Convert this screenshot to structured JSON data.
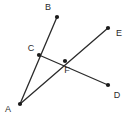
{
  "figure": {
    "type": "geometry-diagram",
    "width": 132,
    "height": 121,
    "background_color": "#ffffff",
    "stroke_color": "#2b2b2b",
    "label_color": "#2b2b2b",
    "point_color": "#1a1a1a",
    "point_radius": 2.1,
    "stroke_width": 1.3,
    "label_font_size": 9
  },
  "points": [
    {
      "id": "A",
      "label": "A",
      "x": 20,
      "y": 104,
      "label_x": 8,
      "label_y": 110
    },
    {
      "id": "B",
      "label": "B",
      "x": 57,
      "y": 17,
      "label_x": 48,
      "label_y": 8
    },
    {
      "id": "C",
      "label": "C",
      "x": 39,
      "y": 55,
      "label_x": 31,
      "label_y": 49
    },
    {
      "id": "D",
      "label": "D",
      "x": 108,
      "y": 85,
      "label_x": 117,
      "label_y": 96
    },
    {
      "id": "E",
      "label": "E",
      "x": 108,
      "y": 28,
      "label_x": 119,
      "label_y": 34
    },
    {
      "id": "F",
      "label": "F",
      "x": 65,
      "y": 61,
      "label_x": 67,
      "label_y": 71
    }
  ],
  "segments": [
    {
      "id": "AB",
      "from": "A",
      "to": "B",
      "through": [
        "C"
      ]
    },
    {
      "id": "AE",
      "from": "A",
      "to": "E",
      "through": [
        "F"
      ]
    },
    {
      "id": "CD",
      "from": "C",
      "to": "D",
      "through": [
        "F"
      ]
    }
  ]
}
